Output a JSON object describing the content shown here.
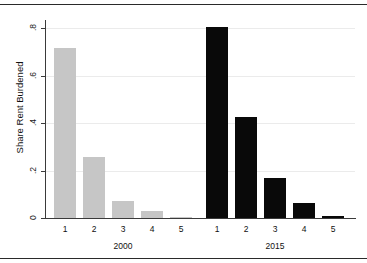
{
  "chart_data": {
    "type": "bar",
    "title": "",
    "subtitle": "",
    "xlabel": "",
    "ylabel": "Share Rent Burdened",
    "ylim": [
      0,
      0.8
    ],
    "yticks": [
      "0",
      ".2",
      ".4",
      ".6",
      ".8"
    ],
    "ytick_values": [
      0,
      0.2,
      0.4,
      0.6,
      0.8
    ],
    "grid": true,
    "legend": "none",
    "categories": [
      "1",
      "2",
      "3",
      "4",
      "5"
    ],
    "groups": [
      {
        "name": "2000",
        "color": "#c6c6c6",
        "categories": [
          "1",
          "2",
          "3",
          "4",
          "5"
        ],
        "values": [
          0.716,
          0.257,
          0.072,
          0.029,
          0.005
        ]
      },
      {
        "name": "2015",
        "color": "#090909",
        "categories": [
          "1",
          "2",
          "3",
          "4",
          "5"
        ],
        "values": [
          0.805,
          0.425,
          0.168,
          0.063,
          0.008
        ]
      }
    ]
  },
  "axis": {
    "y_label": "Share Rent Burdened",
    "y_tick_0": "0",
    "y_tick_1": ".2",
    "y_tick_2": ".4",
    "y_tick_3": ".6",
    "y_tick_4": ".8"
  },
  "group_labels": {
    "first": "2000",
    "second": "2015"
  },
  "x_labels": {
    "g0c0": "1",
    "g0c1": "2",
    "g0c2": "3",
    "g0c3": "4",
    "g0c4": "5",
    "g1c0": "1",
    "g1c1": "2",
    "g1c2": "3",
    "g1c3": "4",
    "g1c4": "5"
  }
}
